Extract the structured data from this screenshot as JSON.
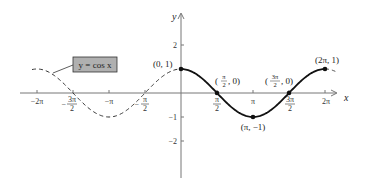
{
  "chart_data": {
    "type": "line",
    "title": "y = cos x",
    "xlabel": "x",
    "ylabel": "y",
    "xlim": [
      -6.5,
      6.6
    ],
    "ylim": [
      -3,
      3
    ],
    "grid": false,
    "x_ticks": [
      "-2π",
      "-3π/2",
      "-π",
      "-π/2",
      "π/2",
      "π",
      "3π/2",
      "2π"
    ],
    "y_ticks": [
      "2",
      "1",
      "-1",
      "-2"
    ],
    "series": [
      {
        "name": "y = cos x (solid, one period)",
        "style": "solid",
        "x_range": [
          0,
          6.2832
        ]
      },
      {
        "name": "y = cos x (dashed extension)",
        "style": "dashed",
        "x_range": [
          -6.5,
          0
        ]
      }
    ],
    "key_points": [
      {
        "label": "(0, 1)",
        "x": 0,
        "y": 1
      },
      {
        "label": "(π/2, 0)",
        "x": 1.5708,
        "y": 0
      },
      {
        "label": "(π, −1)",
        "x": 3.1416,
        "y": -1
      },
      {
        "label": "(3π/2, 0)",
        "x": 4.7124,
        "y": 0
      },
      {
        "label": "(2π, 1)",
        "x": 6.2832,
        "y": 1
      }
    ],
    "legend_box": "y = cos x"
  },
  "labels": {
    "legend": "y = cos x",
    "axis_x": "x",
    "axis_y": "y",
    "ytick_2": "2",
    "ytick_neg1": "−1",
    "ytick_neg2": "−2",
    "xtick_neg2pi": "−2π",
    "xtick_negpi": "−π",
    "xtick_pi": "π",
    "xtick_2pi": "2π",
    "frac_3pi": "3π",
    "frac_pi": "π",
    "frac_2": "2",
    "minus": "−",
    "pt_0_1": "(0, 1)",
    "pt_pi_neg1": "(π, −1)",
    "pt_2pi_1": "(2π, 1)",
    "pt_half_open": "(",
    "pt_half_close": ", 0)"
  },
  "colors": {
    "curve": "#111111",
    "axis": "#777777",
    "legend_fill": "#b0b0b0",
    "legend_border": "#333333"
  }
}
